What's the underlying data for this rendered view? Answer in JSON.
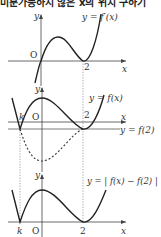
{
  "title": "미분가능하지 않은 x의 위치 구하기",
  "graphs": [
    {
      "name": "derivative-graph",
      "curve_label": "y = f′(x)",
      "y_axis_label": "y",
      "x_axis_label": "x",
      "origin_label": "O",
      "tick_labels": [
        "2"
      ]
    },
    {
      "name": "function-graph",
      "curve_label": "y = f(x)",
      "line_label": "y = f(2)",
      "y_axis_label": "y",
      "x_axis_label": "x",
      "origin_label": "O",
      "tick_labels": [
        "k",
        "2"
      ]
    },
    {
      "name": "absolute-graph",
      "curve_label": "y = | f(x) − f(2) |",
      "y_axis_label": "y",
      "x_axis_label": "x",
      "origin_label": "O",
      "tick_labels": [
        "k",
        "2"
      ]
    }
  ]
}
